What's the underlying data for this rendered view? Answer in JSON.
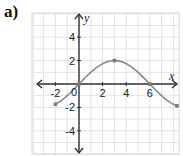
{
  "part_label": "a)",
  "chart_data": {
    "type": "line",
    "title": "",
    "xlabel": "x",
    "ylabel": "y",
    "origin_label": "0",
    "xlim": [
      -4,
      8.4
    ],
    "ylim": [
      -6,
      6
    ],
    "grid": true,
    "x_ticks": [
      -2,
      2,
      4,
      6
    ],
    "x_tick_labels": [
      "-2",
      "2",
      "4",
      "6"
    ],
    "y_ticks": [
      4,
      2,
      -2,
      -4
    ],
    "y_tick_labels": [
      "4",
      "2",
      "-2",
      "-4"
    ],
    "series": [
      {
        "name": "f(x)",
        "description": "sinusoidal curve y = 2 sin(pi x / 6)",
        "x": [
          -2,
          -1,
          0,
          1,
          2,
          3,
          4,
          5,
          6,
          7,
          8,
          8.3
        ],
        "y": [
          -1.73,
          -1,
          0,
          1,
          1.73,
          2,
          1.73,
          1,
          0,
          -1,
          -1.73,
          -1.87
        ],
        "color": "#8a8a8a"
      }
    ],
    "marked_points": [
      {
        "x": -2,
        "y": -2
      },
      {
        "x": 0,
        "y": 0
      },
      {
        "x": 3,
        "y": 2
      },
      {
        "x": 6,
        "y": 0
      },
      {
        "x": 8.3,
        "y": -2.1
      }
    ],
    "colors": {
      "grid": "#e2e2e2",
      "axis": "#333333",
      "curve": "#8a8a8a",
      "frame": "#d8d8d8"
    }
  }
}
